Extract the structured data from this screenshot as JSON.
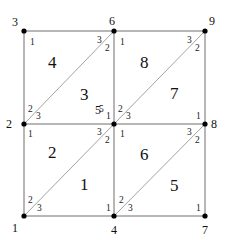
{
  "diagram": {
    "type": "finite-element-mesh",
    "colors": {
      "edge": "#6e6e6e",
      "node": "#000000",
      "text": "#111111"
    },
    "nodes": [
      {
        "id": "1",
        "label": "1",
        "x": 24,
        "y": 216,
        "lx": 12,
        "ly": 232
      },
      {
        "id": "2",
        "label": "2",
        "x": 24,
        "y": 124,
        "lx": 6,
        "ly": 128
      },
      {
        "id": "3",
        "label": "3",
        "x": 24,
        "y": 31,
        "lx": 12,
        "ly": 26
      },
      {
        "id": "4",
        "label": "4",
        "x": 114,
        "y": 216,
        "lx": 111,
        "ly": 234
      },
      {
        "id": "5",
        "label": "5",
        "x": 114,
        "y": 124,
        "lx": 95,
        "ly": 114
      },
      {
        "id": "6",
        "label": "6",
        "x": 114,
        "y": 31,
        "lx": 109,
        "ly": 25
      },
      {
        "id": "7",
        "label": "7",
        "x": 205,
        "y": 216,
        "lx": 110,
        "ly": 234
      },
      {
        "id": "8",
        "label": "8",
        "x": 205,
        "y": 124,
        "lx": 211,
        "ly": 128
      },
      {
        "id": "9",
        "label": "9",
        "x": 205,
        "y": 31,
        "lx": 209,
        "ly": 25
      }
    ],
    "elements": [
      {
        "id": "1",
        "label": "1",
        "nodes": [
          "1",
          "4",
          "5"
        ],
        "lx": 80,
        "ly": 190
      },
      {
        "id": "2",
        "label": "2",
        "nodes": [
          "5",
          "2",
          "1"
        ],
        "lx": 48,
        "ly": 158
      },
      {
        "id": "3",
        "label": "3",
        "nodes": [
          "2",
          "5",
          "6"
        ],
        "lx": 80,
        "ly": 100
      },
      {
        "id": "4",
        "label": "4",
        "nodes": [
          "6",
          "3",
          "2"
        ],
        "lx": 48,
        "ly": 68
      },
      {
        "id": "5",
        "label": "5",
        "nodes": [
          "7",
          "8",
          "4"
        ],
        "lx": 170,
        "ly": 191
      },
      {
        "id": "6",
        "label": "6",
        "nodes": [
          "5",
          "4",
          "8"
        ],
        "lx": 140,
        "ly": 160
      },
      {
        "id": "7",
        "label": "7",
        "nodes": [
          "8",
          "9",
          "5"
        ],
        "lx": 170,
        "ly": 99
      },
      {
        "id": "8",
        "label": "8",
        "nodes": [
          "6",
          "5",
          "9"
        ],
        "lx": 140,
        "ly": 68
      }
    ],
    "local_labels": [
      {
        "text": "1",
        "x": 30,
        "y": 45
      },
      {
        "text": "3",
        "x": 97,
        "y": 43
      },
      {
        "text": "2",
        "x": 105,
        "y": 51
      },
      {
        "text": "2",
        "x": 28,
        "y": 112
      },
      {
        "text": "3",
        "x": 36,
        "y": 119
      },
      {
        "text": "5",
        "x": 99,
        "y": 112
      },
      {
        "text": "1",
        "x": 106,
        "y": 119
      },
      {
        "text": "1",
        "x": 120,
        "y": 45
      },
      {
        "text": "3",
        "x": 187,
        "y": 43
      },
      {
        "text": "2",
        "x": 195,
        "y": 51
      },
      {
        "text": "2",
        "x": 118,
        "y": 112
      },
      {
        "text": "3",
        "x": 126,
        "y": 119
      },
      {
        "text": "1",
        "x": 196,
        "y": 119
      },
      {
        "text": "1",
        "x": 28,
        "y": 137
      },
      {
        "text": "3",
        "x": 97,
        "y": 135
      },
      {
        "text": "2",
        "x": 105,
        "y": 143
      },
      {
        "text": "2",
        "x": 28,
        "y": 203
      },
      {
        "text": "3",
        "x": 37,
        "y": 211
      },
      {
        "text": "1",
        "x": 106,
        "y": 211
      },
      {
        "text": "1",
        "x": 120,
        "y": 137
      },
      {
        "text": "3",
        "x": 187,
        "y": 135
      },
      {
        "text": "2",
        "x": 195,
        "y": 143
      },
      {
        "text": "2",
        "x": 119,
        "y": 203
      },
      {
        "text": "3",
        "x": 128,
        "y": 211
      },
      {
        "text": "1",
        "x": 196,
        "y": 211
      }
    ]
  }
}
